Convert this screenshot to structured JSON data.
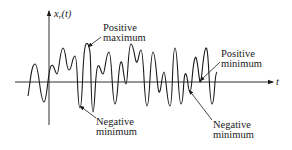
{
  "diagram": {
    "title": "",
    "y_axis": {
      "label_main": "x",
      "label_sub": "r",
      "label_arg": "(t)"
    },
    "x_axis": {
      "label": "t"
    },
    "annotations": [
      {
        "id": "positive-maximum",
        "line1": "Positive",
        "line2": "maximum"
      },
      {
        "id": "positive-minimum",
        "line1": "Positive",
        "line2": "minimum"
      },
      {
        "id": "negative-minimum-1",
        "line1": "Negative",
        "line2": "minimum"
      },
      {
        "id": "negative-minimum-2",
        "line1": "Negative",
        "line2": "minimum"
      }
    ],
    "colors": {
      "stroke": "#1a1a1a",
      "background": "#ffffff"
    }
  }
}
